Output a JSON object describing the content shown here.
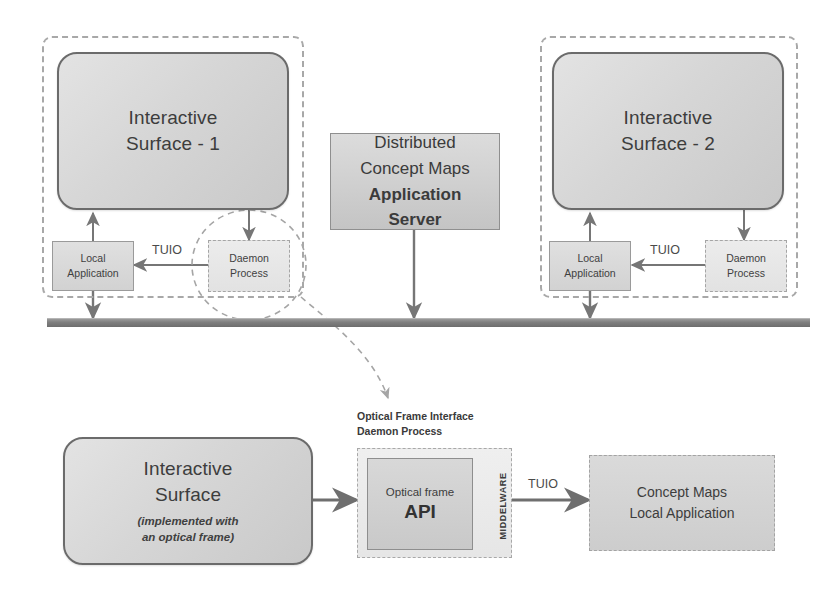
{
  "diagram": {
    "colors": {
      "box_fill": "#d6d6d6",
      "box_border": "#6b6b6b",
      "group_dash": "#a8a8a8",
      "bus": "#7f7f7f",
      "text": "#404040"
    }
  },
  "top": {
    "left_group": {
      "surface_line1": "Interactive",
      "surface_line2": "Surface - 1",
      "local_app_line1": "Local",
      "local_app_line2": "Application",
      "daemon_line1": "Daemon",
      "daemon_line2": "Process",
      "tuio_label": "TUIO"
    },
    "server": {
      "line1": "Distributed",
      "line2": "Concept Maps",
      "line3": "Application",
      "line4": "Server"
    },
    "right_group": {
      "surface_line1": "Interactive",
      "surface_line2": "Surface - 2",
      "local_app_line1": "Local",
      "local_app_line2": "Application",
      "daemon_line1": "Daemon",
      "daemon_line2": "Process",
      "tuio_label": "TUIO"
    }
  },
  "bottom": {
    "surface": {
      "line1": "Interactive",
      "line2": "Surface",
      "note_line1": "(implemented with",
      "note_line2": "an optical frame)"
    },
    "daemon_caption_line1": "Optical Frame Interface",
    "daemon_caption_line2": "Daemon Process",
    "api": {
      "caption": "Optical frame",
      "name": "API"
    },
    "middleware_label": "MIDDELWARE",
    "tuio_label": "TUIO",
    "local_app_line1": "Concept Maps",
    "local_app_line2": "Local Application"
  }
}
